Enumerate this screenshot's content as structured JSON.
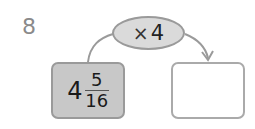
{
  "question": {
    "number": "8"
  },
  "operation": {
    "symbol": "×",
    "operand": "4"
  },
  "input_box": {
    "whole": "4",
    "numerator": "5",
    "denominator": "16",
    "fill": "#c8c8c8"
  },
  "output_box": {
    "value": ""
  },
  "colors": {
    "arrow": "#9a9a9a",
    "oval_fill": "#dadada"
  }
}
